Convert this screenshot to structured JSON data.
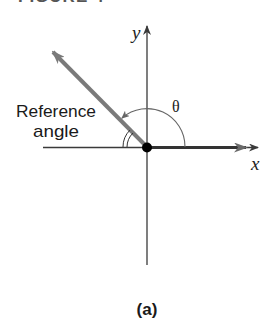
{
  "figure": {
    "title": "FIGURE 4",
    "caption": "(a)"
  },
  "diagram": {
    "x_axis_label": "x",
    "y_axis_label": "y",
    "theta_label": "θ",
    "reference_label_line1": "Reference",
    "reference_label_line2": "angle",
    "colors": {
      "axis": "#3a3a3a",
      "terminal_side": "#7a7a7a",
      "initial_side": "#333333",
      "origin_dot": "#000000",
      "arc": "#666666"
    }
  }
}
